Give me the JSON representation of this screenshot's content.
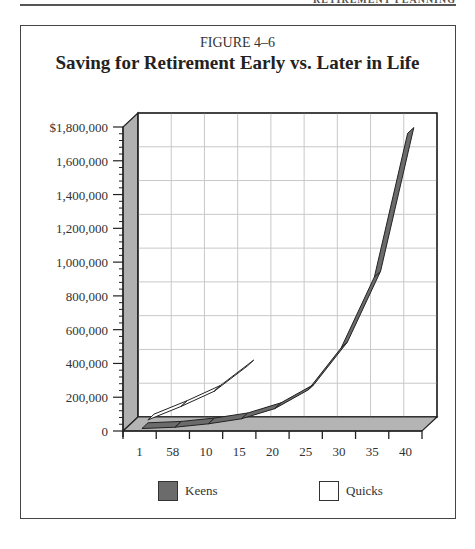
{
  "page": {
    "header_text": "RETIREMENT PLANNING"
  },
  "figure": {
    "label": "FIGURE 4–6",
    "title": "Saving for Retirement Early vs. Later in Life"
  },
  "legend": [
    {
      "name": "Keens",
      "color": "#6b6b6b"
    },
    {
      "name": "Quicks",
      "color": "#ffffff"
    }
  ],
  "colors": {
    "wall": "#b0b0b0",
    "floor": "#b4b4b4",
    "grid": "#c8c8c8",
    "keens": "#6b6b6b",
    "quicks": "#ffffff",
    "outline": "#222222"
  },
  "chart_data": {
    "type": "area",
    "style": "3d-ribbon",
    "title": "Saving for Retirement Early vs. Later in Life",
    "subtitle": "FIGURE 4–6",
    "xlabel": "",
    "ylabel": "",
    "categories": [
      "1",
      "58",
      "10",
      "15",
      "20",
      "25",
      "30",
      "35",
      "40"
    ],
    "y_tick_labels": [
      "0",
      "200,000",
      "400,000",
      "600,000",
      "800,000",
      "1,000,000",
      "1,200,000",
      "1,400,000",
      "1,600,000",
      "$1,800,000"
    ],
    "y_ticks": [
      0,
      200000,
      400000,
      600000,
      800000,
      1000000,
      1200000,
      1400000,
      1600000,
      1800000
    ],
    "ylim": [
      0,
      1800000
    ],
    "grid": true,
    "legend_position": "bottom",
    "series": [
      {
        "name": "Keens",
        "values": [
          2000,
          10000,
          30000,
          60000,
          120000,
          230000,
          480000,
          900000,
          1750000
        ]
      },
      {
        "name": "Quicks",
        "values": [
          20000,
          100000,
          190000,
          340000,
          null,
          null,
          null,
          null,
          null
        ]
      }
    ]
  }
}
